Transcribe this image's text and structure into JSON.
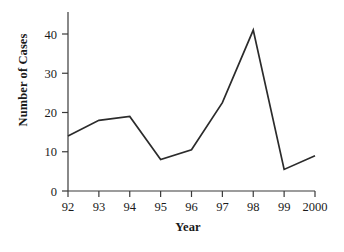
{
  "chart_data": {
    "type": "line",
    "title": "",
    "xlabel": "Year",
    "ylabel": "Number of Cases",
    "categories": [
      "92",
      "93",
      "94",
      "95",
      "96",
      "97",
      "98",
      "99",
      "2000"
    ],
    "values": [
      14,
      18,
      19,
      8,
      10.5,
      22.5,
      41,
      5.5,
      9
    ],
    "series": [
      {
        "name": "Number of Cases",
        "values": [
          14,
          18,
          19,
          8,
          10.5,
          22.5,
          41,
          5.5,
          9
        ]
      }
    ],
    "xtick_labels": [
      "92",
      "93",
      "94",
      "95",
      "96",
      "97",
      "98",
      "99",
      "2000"
    ],
    "ytick_labels": [
      "0",
      "10",
      "20",
      "30",
      "40"
    ],
    "ytick_values": [
      0,
      10,
      20,
      30,
      40
    ],
    "ylim": [
      0,
      45
    ],
    "grid": false,
    "legend": false,
    "line_color": "#2b2b2b",
    "axis_color": "#3a3a3a",
    "background_color": "#ffffff"
  }
}
